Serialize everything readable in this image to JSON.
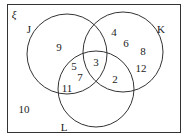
{
  "universal_symbol": "ξ",
  "sets": [
    {
      "name": "J",
      "label_pos": [
        29,
        29
      ]
    },
    {
      "name": "K",
      "label_pos": [
        161,
        29
      ]
    },
    {
      "name": "L",
      "label_pos": [
        64,
        127
      ]
    }
  ],
  "regions": [
    {
      "id": "J_only",
      "value": "9",
      "pos": [
        59,
        47
      ]
    },
    {
      "id": "K_only_1",
      "value": "4",
      "pos": [
        114,
        32
      ]
    },
    {
      "id": "K_only_2",
      "value": "6",
      "pos": [
        126,
        43
      ]
    },
    {
      "id": "K_only_3",
      "value": "8",
      "pos": [
        143,
        51
      ]
    },
    {
      "id": "K_only_4",
      "value": "12",
      "pos": [
        141,
        68
      ]
    },
    {
      "id": "J_and_L_1",
      "value": "5",
      "pos": [
        74,
        66
      ]
    },
    {
      "id": "J_and_L_2",
      "value": "7",
      "pos": [
        80,
        77
      ]
    },
    {
      "id": "J_and_L_3",
      "value": "11",
      "pos": [
        67,
        88
      ]
    },
    {
      "id": "J_K_L",
      "value": "3",
      "pos": [
        96,
        62
      ]
    },
    {
      "id": "K_and_L",
      "value": "2",
      "pos": [
        115,
        79
      ]
    },
    {
      "id": "outside",
      "value": "10",
      "pos": [
        24,
        109
      ]
    }
  ]
}
